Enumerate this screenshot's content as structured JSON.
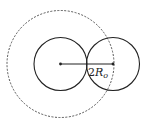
{
  "diagram": {
    "stroke_color": "#222222",
    "dashed_color": "#555555",
    "central_circle": {
      "cx": 60.5,
      "cy": 64,
      "r": 26.5
    },
    "adjacent_circle": {
      "cx": 113,
      "cy": 64,
      "r": 26.5
    },
    "dashed_circle": {
      "cx": 60.5,
      "cy": 64,
      "r": 53.5
    },
    "distance_label": {
      "number": "2",
      "symbol": "R",
      "subscript": "o"
    }
  }
}
